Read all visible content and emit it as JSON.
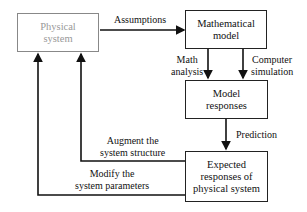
{
  "nodes": {
    "physical_system": [
      "Physical",
      "system"
    ],
    "mathematical_model": [
      "Mathematical",
      "model"
    ],
    "model_responses": [
      "Model",
      "responses"
    ],
    "expected_responses": [
      "Expected",
      "responses of",
      "physical system"
    ]
  },
  "edges": {
    "assumptions": "Assumptions",
    "math_analysis": [
      "Math",
      "analysis"
    ],
    "computer_simulation": [
      "Computer",
      "simulation"
    ],
    "prediction": "Prediction",
    "augment": [
      "Augment the",
      "system structure"
    ],
    "modify": [
      "Modify the",
      "system parameters"
    ]
  },
  "colors": {
    "line": "#111111",
    "physical_box": "#888888",
    "physical_text": "#999999"
  }
}
